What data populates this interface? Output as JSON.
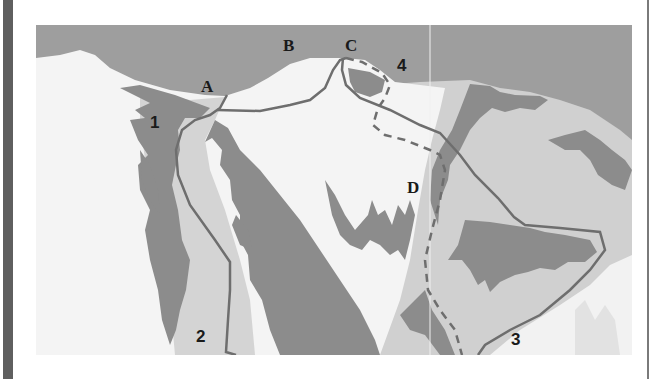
{
  "figure": {
    "type": "mountain route diagram",
    "colors": {
      "sky": "#9e9e9e",
      "snow": "#f4f4f4",
      "light_slope": "#d0d0d0",
      "rock": "#8c8c8c",
      "route_line": "#6e6e6e",
      "border_bar": "#5f5f5f"
    },
    "point_labels": [
      {
        "id": "A",
        "text": "A"
      },
      {
        "id": "B",
        "text": "B"
      },
      {
        "id": "C",
        "text": "C"
      },
      {
        "id": "D",
        "text": "D"
      }
    ],
    "route_labels": [
      {
        "id": "1",
        "text": "1"
      },
      {
        "id": "2",
        "text": "2"
      },
      {
        "id": "3",
        "text": "3"
      },
      {
        "id": "4",
        "text": "4"
      }
    ]
  }
}
